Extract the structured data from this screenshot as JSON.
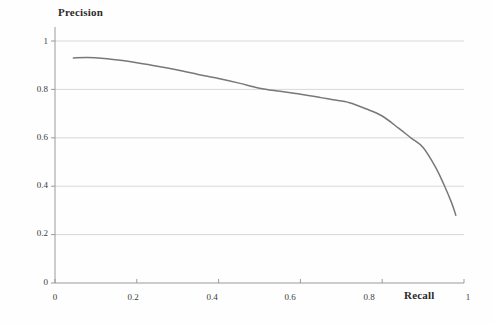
{
  "chart_data": {
    "type": "line",
    "title": "",
    "subtitle": "",
    "xlabel": "Recall",
    "ylabel": "Precision",
    "xlim": [
      0,
      1
    ],
    "ylim": [
      0,
      1
    ],
    "grid": true,
    "grid_axis": "y",
    "legend": false,
    "legend_position": "none",
    "line_color": "#787878",
    "grid_color": "#d8d8d8",
    "axis_color": "#9a9a9a",
    "background": "#fefefe",
    "x_ticks": [
      "0",
      "0.2",
      "0.4",
      "0.6",
      "0.8",
      "1"
    ],
    "y_ticks": [
      "0",
      "0.2",
      "0.4",
      "0.6",
      "0.8",
      "1"
    ],
    "x_tick_values": [
      0,
      0.2,
      0.4,
      0.6,
      0.8,
      1
    ],
    "y_tick_values": [
      0,
      0.2,
      0.4,
      0.6,
      0.8,
      1
    ],
    "series": [
      {
        "name": "precision-recall-curve",
        "x": [
          0.045,
          0.08,
          0.12,
          0.16,
          0.2,
          0.25,
          0.3,
          0.35,
          0.4,
          0.45,
          0.5,
          0.55,
          0.6,
          0.65,
          0.68,
          0.72,
          0.76,
          0.8,
          0.84,
          0.87,
          0.9,
          0.93,
          0.95,
          0.97,
          0.98
        ],
        "y": [
          0.93,
          0.932,
          0.928,
          0.92,
          0.91,
          0.896,
          0.88,
          0.862,
          0.845,
          0.826,
          0.805,
          0.792,
          0.78,
          0.766,
          0.757,
          0.745,
          0.72,
          0.69,
          0.64,
          0.6,
          0.56,
          0.48,
          0.41,
          0.33,
          0.28
        ]
      }
    ],
    "annotations": []
  },
  "axes": {
    "y_axis_title": "Precision",
    "x_axis_title": "Recall"
  }
}
